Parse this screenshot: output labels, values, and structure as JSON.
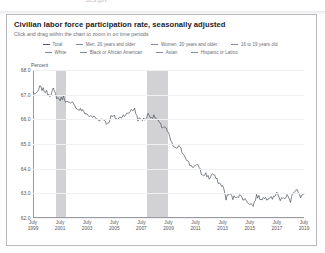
{
  "top_strip_text": "BLS.gov",
  "card": {
    "title": "Civilian labor force participation rate, seasonally adjusted",
    "subtitle": "Click and drag within the chart to zoom in on time periods"
  },
  "legend": {
    "row1": [
      {
        "label": "Total",
        "color": "#4a5a6e"
      },
      {
        "label": "Men, 20 years and older",
        "color": "#7d8b9c"
      },
      {
        "label": "Women, 20 years and older",
        "color": "#7d8b9c"
      },
      {
        "label": "16 to 19 years old",
        "color": "#7d8b9c"
      }
    ],
    "row2": [
      {
        "label": "White",
        "color": "#7d8b9c"
      },
      {
        "label": "Black or African American",
        "color": "#7d8b9c"
      },
      {
        "label": "Asian",
        "color": "#7d8b9c"
      },
      {
        "label": "Hispanic or Latino",
        "color": "#7d8b9c"
      }
    ]
  },
  "chart_data": {
    "type": "line",
    "title": "Civilian labor force participation rate, seasonally adjusted",
    "xlabel": "",
    "ylabel": "Percent",
    "ylim": [
      62.0,
      68.0
    ],
    "yticks": [
      "62.0",
      "63.0",
      "64.0",
      "65.0",
      "66.0",
      "67.0",
      "68.0"
    ],
    "grid": true,
    "legend_position": "top",
    "xlim": [
      1999.5,
      2019.5
    ],
    "xticks": [
      {
        "month": "July",
        "year": "1999",
        "value": 1999.5
      },
      {
        "month": "July",
        "year": "2001",
        "value": 2001.5
      },
      {
        "month": "July",
        "year": "2003",
        "value": 2003.5
      },
      {
        "month": "July",
        "year": "2005",
        "value": 2005.5
      },
      {
        "month": "July",
        "year": "2007",
        "value": 2007.5
      },
      {
        "month": "July",
        "year": "2009",
        "value": 2009.5
      },
      {
        "month": "July",
        "year": "2011",
        "value": 2011.5
      },
      {
        "month": "July",
        "year": "2013",
        "value": 2013.5
      },
      {
        "month": "July",
        "year": "2015",
        "value": 2015.5
      },
      {
        "month": "July",
        "year": "2017",
        "value": 2017.5
      },
      {
        "month": "July",
        "year": "2019",
        "value": 2019.5
      }
    ],
    "recession_bands": [
      {
        "start": 2001.2,
        "end": 2001.9,
        "color": "#d2d2d4"
      },
      {
        "start": 2007.9,
        "end": 2009.5,
        "color": "#d2d2d4"
      }
    ],
    "series": [
      {
        "name": "Total",
        "color": "#545c66",
        "x": [
          1999.5,
          1999.75,
          2000.0,
          2000.25,
          2000.5,
          2000.75,
          2001.0,
          2001.25,
          2001.5,
          2001.75,
          2002.0,
          2002.25,
          2002.5,
          2002.75,
          2003.0,
          2003.25,
          2003.5,
          2003.75,
          2004.0,
          2004.25,
          2004.5,
          2004.75,
          2005.0,
          2005.25,
          2005.5,
          2005.75,
          2006.0,
          2006.25,
          2006.5,
          2006.75,
          2007.0,
          2007.25,
          2007.5,
          2007.75,
          2008.0,
          2008.25,
          2008.5,
          2008.75,
          2009.0,
          2009.25,
          2009.5,
          2009.75,
          2010.0,
          2010.25,
          2010.5,
          2010.75,
          2011.0,
          2011.25,
          2011.5,
          2011.75,
          2012.0,
          2012.25,
          2012.5,
          2012.75,
          2013.0,
          2013.25,
          2013.5,
          2013.75,
          2014.0,
          2014.25,
          2014.5,
          2014.75,
          2015.0,
          2015.25,
          2015.5,
          2015.75,
          2016.0,
          2016.25,
          2016.5,
          2016.75,
          2017.0,
          2017.25,
          2017.5,
          2017.75,
          2018.0,
          2018.25,
          2018.5,
          2018.75,
          2019.0,
          2019.25,
          2019.5
        ],
        "y": [
          67.1,
          67.0,
          67.3,
          67.2,
          67.1,
          67.0,
          67.2,
          66.9,
          66.8,
          66.9,
          66.7,
          66.6,
          66.7,
          66.4,
          66.4,
          66.3,
          66.2,
          66.1,
          66.1,
          66.0,
          66.0,
          66.0,
          65.8,
          66.1,
          66.1,
          66.0,
          66.1,
          66.2,
          66.2,
          66.4,
          66.4,
          66.0,
          66.0,
          66.0,
          66.2,
          66.1,
          66.1,
          65.9,
          65.7,
          65.7,
          65.4,
          65.0,
          64.8,
          64.9,
          64.7,
          64.5,
          64.2,
          64.1,
          64.1,
          64.1,
          63.7,
          63.8,
          63.6,
          63.8,
          63.6,
          63.4,
          63.3,
          62.8,
          63.0,
          62.8,
          62.9,
          62.9,
          62.8,
          62.7,
          62.6,
          62.5,
          62.9,
          62.8,
          62.8,
          62.8,
          62.9,
          62.8,
          63.1,
          62.7,
          62.8,
          62.9,
          62.7,
          63.1,
          63.2,
          62.8,
          63.0
        ]
      }
    ]
  }
}
